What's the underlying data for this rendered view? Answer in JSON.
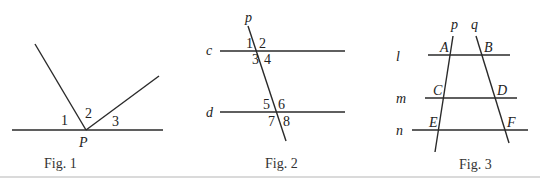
{
  "figures": [
    {
      "caption": "Fig. 1",
      "point_label": "P",
      "angle_labels": [
        "1",
        "2",
        "3"
      ]
    },
    {
      "caption": "Fig. 2",
      "transversal_label": "p",
      "line_labels": [
        "c",
        "d"
      ],
      "angle_labels": [
        "1",
        "2",
        "3",
        "4",
        "5",
        "6",
        "7",
        "8"
      ]
    },
    {
      "caption": "Fig. 3",
      "transversal_labels": [
        "p",
        "q"
      ],
      "line_labels": [
        "l",
        "m",
        "n"
      ],
      "point_labels": [
        "A",
        "B",
        "C",
        "D",
        "E",
        "F"
      ]
    }
  ]
}
